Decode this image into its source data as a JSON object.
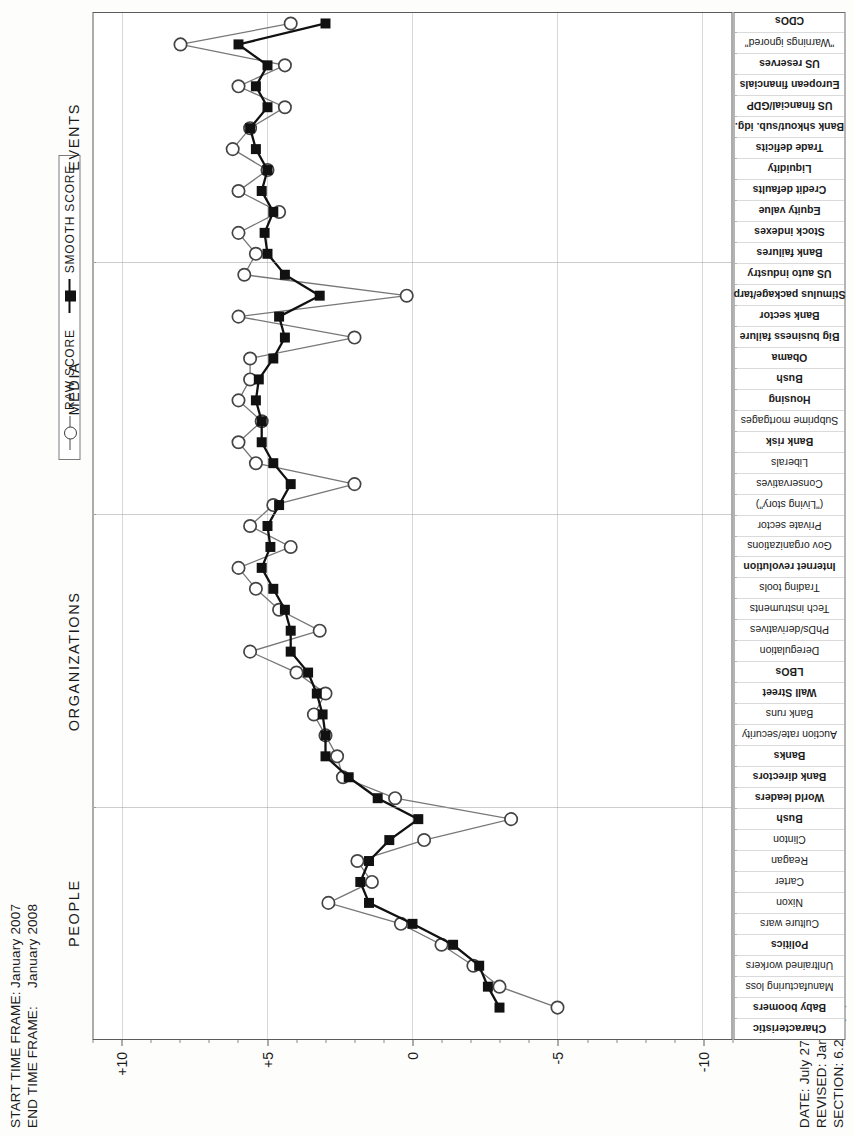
{
  "header": {
    "start_label": "START TIME FRAME:",
    "start_value": "January 2007",
    "end_label": "END TIME FRAME:",
    "end_value": "January 2008",
    "date_line": "DATE: July 27, 2011",
    "revised_line": "REVISED: Jan. 10, 2012",
    "section_line": "SECTION: 6.2.1 (rs)"
  },
  "legend": {
    "raw": "RAW SCORE",
    "smooth": "SMOOTH SCORE"
  },
  "axis": {
    "y_title": "QUALITATIVE SCALE",
    "y_ticks": [
      "+10",
      "+5",
      "0",
      "-5",
      "-10"
    ],
    "x_header": "Characteristic"
  },
  "sections": [
    {
      "label": "PEOPLE"
    },
    {
      "label": "ORGANIZATIONS"
    },
    {
      "label": "MEDIA"
    },
    {
      "label": "EVENTS"
    }
  ],
  "chart_data": {
    "type": "line",
    "title": "",
    "xlabel": "Characteristic",
    "ylabel": "QUALITATIVE SCALE",
    "ylim": [
      -11,
      11
    ],
    "grid": true,
    "legend_position": "top-right",
    "categories": [
      "Baby boomers",
      "Manufacturing loss",
      "Unltrained workers",
      "Politics",
      "Culture wars",
      "Nixon",
      "Carter",
      "Reagan",
      "Clinton",
      "Bush",
      "World leaders",
      "Bank directors",
      "Banks",
      "Auction rate/security",
      "Bank runs",
      "Wall Street",
      "LBOs",
      "Deregulation",
      "PhDs/derivatives",
      "Tech instruments",
      "Trading tools",
      "Internet revolution",
      "Gov organizations",
      "Private sector",
      "(\"Living story\")",
      "Conservatives",
      "Liberals",
      "Bank risk",
      "Subprime mortgages",
      "Housing",
      "Bush",
      "Obama",
      "Big business failure",
      "Bank sector",
      "Stimulus package/tarp",
      "US auto industry",
      "Bank failures",
      "Stock indexes",
      "Equity value",
      "Credit defaults",
      "Liquidity",
      "Trade deficits",
      "Bank shkout/sub. idg.",
      "US financial/GDP",
      "European financials",
      "US reserves",
      "\"Warnings ignored\"",
      "CDOs"
    ],
    "bold_categories": [
      "Baby boomers",
      "Politics",
      "World leaders",
      "Bank directors",
      "Banks",
      "Wall Street",
      "LBOs",
      "Internet revolution",
      "Bank risk",
      "Housing",
      "Bush",
      "Obama",
      "Big business failure",
      "Bank sector",
      "Stimulus package/tarp",
      "US auto industry",
      "Bank failures",
      "Stock indexes",
      "Equity value",
      "Credit defaults",
      "Liquidity",
      "Trade deficits",
      "Bank shkout/sub. idg.",
      "US financial/GDP",
      "European financials",
      "US reserves",
      "CDOs"
    ],
    "section_bounds": [
      {
        "label": "PEOPLE",
        "start": 0,
        "end": 9
      },
      {
        "label": "ORGANIZATIONS",
        "start": 10,
        "end": 23
      },
      {
        "label": "MEDIA",
        "start": 24,
        "end": 35
      },
      {
        "label": "EVENTS",
        "start": 36,
        "end": 47
      }
    ],
    "series": [
      {
        "name": "RAW SCORE",
        "marker": "open-circle",
        "color": "#777777",
        "values": [
          -5.0,
          -3.0,
          -2.1,
          -1.0,
          0.4,
          2.9,
          1.4,
          1.9,
          -0.4,
          -3.4,
          0.6,
          2.4,
          2.6,
          3.0,
          3.4,
          3.0,
          4.0,
          5.6,
          3.2,
          4.6,
          5.4,
          6.0,
          4.2,
          5.6,
          4.8,
          2.0,
          5.4,
          6.0,
          5.2,
          6.0,
          5.6,
          5.6,
          2.0,
          6.0,
          0.2,
          5.8,
          5.4,
          6.0,
          4.6,
          6.0,
          5.0,
          6.2,
          5.6,
          4.4,
          6.0,
          4.4,
          8.0,
          4.2
        ]
      },
      {
        "name": "SMOOTH SCORE",
        "marker": "filled-square",
        "color": "#111111",
        "values": [
          -3.0,
          -2.6,
          -2.3,
          -1.4,
          0.0,
          1.5,
          1.8,
          1.5,
          0.8,
          -0.2,
          1.2,
          2.2,
          3.0,
          3.0,
          3.1,
          3.3,
          3.6,
          4.2,
          4.2,
          4.4,
          4.8,
          5.2,
          4.9,
          5.0,
          4.6,
          4.2,
          4.8,
          5.2,
          5.2,
          5.4,
          5.3,
          4.8,
          4.4,
          4.6,
          3.2,
          4.4,
          5.0,
          5.1,
          4.8,
          5.2,
          5.0,
          5.4,
          5.6,
          5.0,
          5.4,
          5.0,
          6.0,
          3.0
        ]
      }
    ]
  }
}
